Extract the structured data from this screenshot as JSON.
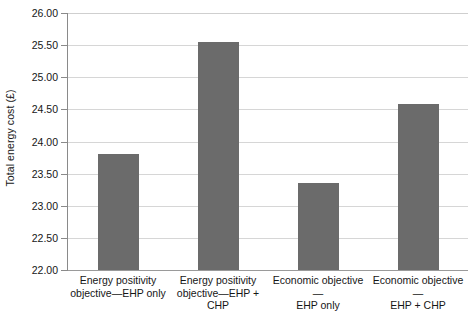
{
  "chart_data": {
    "type": "bar",
    "title": "",
    "xlabel": "",
    "ylabel": "Total energy cost (£)",
    "categories": [
      "Energy positivity objective—EHP only",
      "Energy positivity objective—EHP + CHP",
      "Economic objective—EHP only",
      "Economic objective—EHP + CHP"
    ],
    "values": [
      23.81,
      25.55,
      23.35,
      24.59
    ],
    "ylim": [
      22.0,
      26.0
    ],
    "ytick_step": 0.5,
    "ytick_labels": [
      "26.00",
      "25.50",
      "25.00",
      "24.50",
      "24.00",
      "23.50",
      "23.00",
      "22.50",
      "22.00"
    ],
    "ytick_values": [
      26.0,
      25.5,
      25.0,
      24.5,
      24.0,
      23.5,
      23.0,
      22.5,
      22.0
    ],
    "grid": true,
    "legend": false,
    "bar_color": "#6b6b6b",
    "gridline_color": "#d6d6d6",
    "axis_color": "#8a8a8a"
  },
  "axis": {
    "y_title": "Total energy cost (£)"
  },
  "x_labels": [
    {
      "line1": "Energy positivity",
      "line2": "objective—EHP only",
      "line3": ""
    },
    {
      "line1": "Energy positivity",
      "line2": "objective—EHP +",
      "line3": "CHP"
    },
    {
      "line1": "Economic objective—",
      "line2": "EHP only",
      "line3": ""
    },
    {
      "line1": "Economic objective—",
      "line2": "EHP + CHP",
      "line3": ""
    }
  ]
}
